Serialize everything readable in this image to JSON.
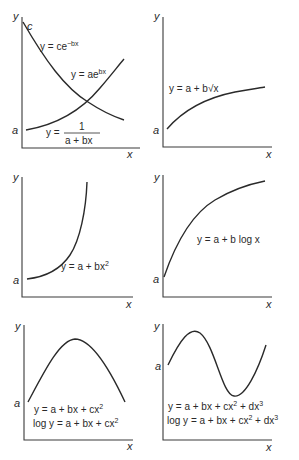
{
  "figure": {
    "axis_labels": {
      "x": "x",
      "y": "y"
    },
    "panels": [
      {
        "id": "exponential-reciprocal",
        "intercepts": [
          "c",
          "a"
        ],
        "equations": [
          {
            "lhs": "y = ce",
            "sup": "−bx"
          },
          {
            "lhs": "y = ae",
            "sup": "bx"
          },
          {
            "lhs": "y = ",
            "numerator": "1",
            "denominator": "a + bx"
          }
        ]
      },
      {
        "id": "square-root",
        "intercepts": [
          "a"
        ],
        "equations": [
          {
            "text": "y = a + b√x"
          }
        ]
      },
      {
        "id": "quadratic-growth",
        "intercepts": [
          "a"
        ],
        "equations": [
          {
            "lhs": "y = a + bx",
            "sup": "2"
          }
        ]
      },
      {
        "id": "logarithmic",
        "intercepts": [
          "a"
        ],
        "equations": [
          {
            "text": "y = a + b log x"
          }
        ]
      },
      {
        "id": "parabola",
        "intercepts": [
          "a"
        ],
        "equations": [
          {
            "lhs": "y = a + bx + cx",
            "sup": "2"
          },
          {
            "lhs": "log y = a + bx + cx",
            "sup": "2"
          }
        ]
      },
      {
        "id": "cubic",
        "intercepts": [
          "a"
        ],
        "equations": [
          {
            "lhs": "y = a + bx + cx",
            "sup1": "2",
            "mid": " + dx",
            "sup": "3"
          },
          {
            "lhs": "log y = a + bx + cx",
            "sup1": "2",
            "mid": " + dx",
            "sup": "3"
          }
        ]
      }
    ]
  }
}
